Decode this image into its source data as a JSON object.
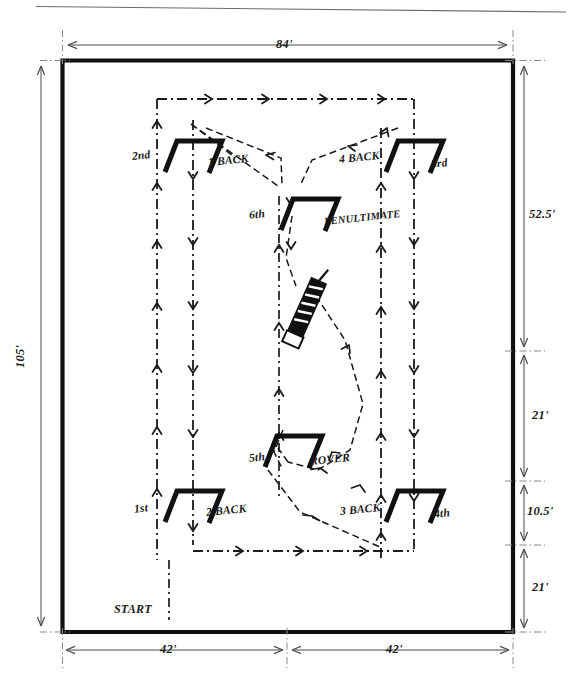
{
  "diagram": {
    "kind": "hand-drawn court plan"
  },
  "dimensions": {
    "top_width": "84'",
    "left_height": "105'",
    "right_upper": "52.5'",
    "right_mid_upper": "21'",
    "right_mid_lower": "10.5'",
    "right_lower": "21'",
    "bottom_left": "42'",
    "bottom_right": "42'"
  },
  "wickets": [
    {
      "id": "w2nd",
      "label": "2nd",
      "ord": "nd",
      "base": "2"
    },
    {
      "id": "w1back",
      "label": "1 BACK"
    },
    {
      "id": "w4back",
      "label": "4 BACK"
    },
    {
      "id": "w3rd",
      "label": "3rd",
      "ord": "rd",
      "base": "3"
    },
    {
      "id": "w6th",
      "label": "6th",
      "ord": "th",
      "base": "6"
    },
    {
      "id": "wpenult",
      "label": "PENULTIMATE"
    },
    {
      "id": "w5th",
      "label": "5th",
      "ord": "th",
      "base": "5"
    },
    {
      "id": "wrover",
      "label": "ROVER"
    },
    {
      "id": "w1st",
      "label": "1st",
      "ord": "st",
      "base": "1"
    },
    {
      "id": "w2back",
      "label": "2 BACK"
    },
    {
      "id": "w3back",
      "label": "3 BACK"
    },
    {
      "id": "w4th",
      "label": "4th",
      "ord": "th",
      "base": "4"
    }
  ],
  "markers": {
    "start": "START",
    "center_peg": "center-stake"
  },
  "colors": {
    "ink": "#1a1a1a",
    "boundary": "#111111",
    "thin_rule": "#6b6b6b",
    "paper": "#ffffff"
  }
}
